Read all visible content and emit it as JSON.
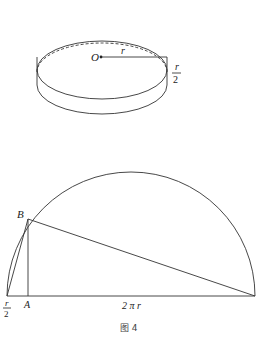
{
  "figure": {
    "caption": "图 4",
    "cylinder": {
      "center_label": "O",
      "radius_label": "r",
      "height_label_num": "r",
      "height_label_den": "2"
    },
    "semicircle": {
      "point_b_label": "B",
      "point_a_label": "A",
      "left_label_num": "r",
      "left_label_den": "2",
      "base_label": "2 π r"
    }
  }
}
